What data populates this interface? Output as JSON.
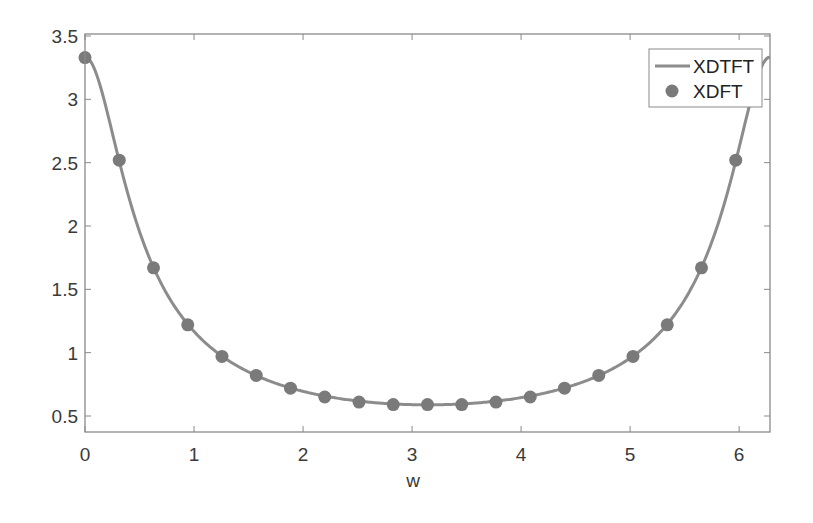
{
  "chart_data": {
    "type": "line",
    "title": "",
    "xlabel": "w",
    "ylabel": "",
    "xlim": [
      0,
      6.2832
    ],
    "ylim": [
      0.38,
      3.52
    ],
    "grid": false,
    "legend_position": "upper right",
    "xticks": [
      "0",
      "1",
      "2",
      "3",
      "4",
      "5",
      "6"
    ],
    "yticks": [
      "0.5",
      "1",
      "1.5",
      "2",
      "2.5",
      "3",
      "3.5"
    ],
    "series": [
      {
        "name": "XDTFT",
        "style": "line",
        "color": "#8c8c8c",
        "formula": "|1/(1-0.7e^{-jw})|"
      },
      {
        "name": "XDFT",
        "style": "markers",
        "color": "#7a7a7a",
        "x": [
          0,
          0.3142,
          0.6283,
          0.9425,
          1.2566,
          1.5708,
          1.885,
          2.1991,
          2.5133,
          2.8274,
          3.1416,
          3.4558,
          3.7699,
          4.0841,
          4.3982,
          4.7124,
          5.0265,
          5.3407,
          5.6549,
          5.969
        ],
        "values": [
          3.33,
          2.52,
          1.67,
          1.22,
          0.97,
          0.82,
          0.72,
          0.65,
          0.61,
          0.59,
          0.59,
          0.59,
          0.61,
          0.65,
          0.72,
          0.82,
          0.97,
          1.22,
          1.67,
          2.52
        ]
      }
    ]
  },
  "legend": {
    "items": [
      {
        "label": "XDTFT"
      },
      {
        "label": "XDFT"
      }
    ]
  },
  "axis": {
    "xlabel": "w"
  }
}
